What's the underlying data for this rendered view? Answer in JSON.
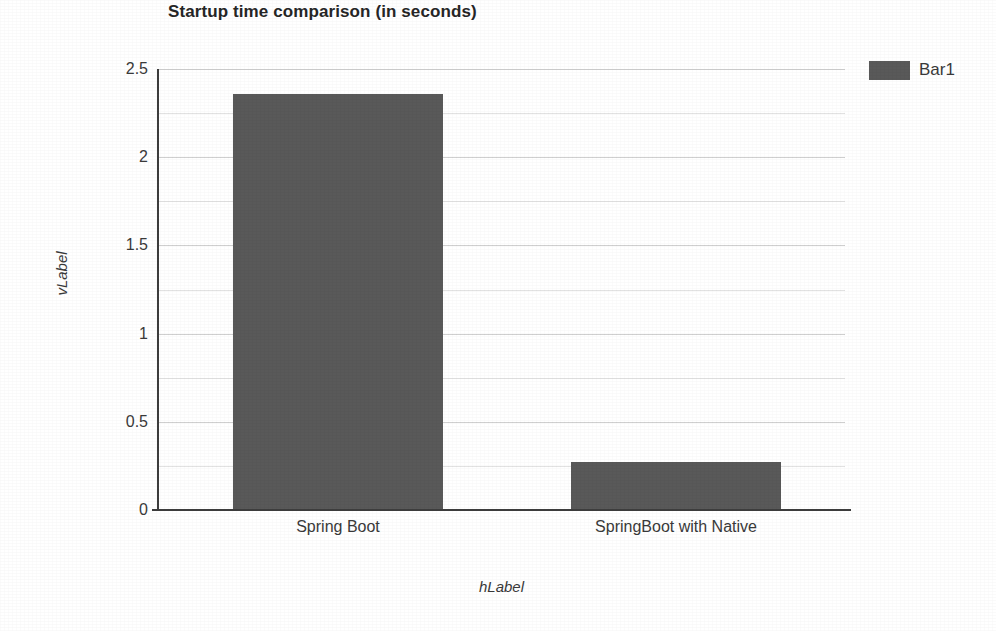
{
  "chart_data": {
    "type": "bar",
    "title": "Startup time comparison (in seconds)",
    "categories": [
      "Spring Boot",
      "SpringBoot with Native"
    ],
    "values": [
      2.36,
      0.27
    ],
    "series": [
      {
        "name": "Bar1",
        "values": [
          2.36,
          0.27
        ]
      }
    ],
    "xlabel": "hLabel",
    "ylabel": "vLabel",
    "ylim": [
      0,
      2.5
    ],
    "ytick_labels": [
      "2.5",
      "2",
      "1.5",
      "1",
      "0.5",
      "0"
    ],
    "ytick_values": [
      2.5,
      2,
      1.5,
      1,
      0.5,
      0
    ],
    "minor_ytick_values": [
      2.25,
      1.75,
      1.25,
      0.75,
      0.25
    ],
    "grid": true,
    "grid_axis": "y",
    "legend_position": "right",
    "legend_entries": [
      "Bar1"
    ],
    "bar_color": "#595959",
    "gridline_color": "#cfcfcf",
    "axis_color": "#3d3d3d",
    "background_color": "#ffffff"
  },
  "legend": {
    "entries": [
      {
        "label": "Bar1",
        "color": "#595959"
      }
    ]
  }
}
